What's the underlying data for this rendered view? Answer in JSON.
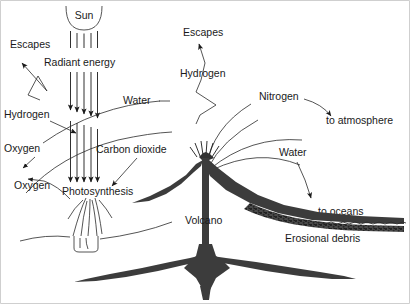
{
  "figure": {
    "background_color": "#ffffff",
    "ink_color": "#1a1a1a",
    "solid_fill_color": "#3c3c3c"
  },
  "labels": {
    "sun": "Sun",
    "escapes_left": "Escapes",
    "radiant_energy": "Radiant energy",
    "hydrogen_left": "Hydrogen",
    "water_left": "Water",
    "oxygen_upper": "Oxygen",
    "carbon_dioxide": "Carbon dioxide",
    "oxygen_lower": "Oxygen",
    "photosynthesis": "Photosynthesis",
    "escapes_right": "Escapes",
    "hydrogen_right": "Hydrogen",
    "nitrogen": "Nitrogen",
    "to_atmosphere": "to atmosphere",
    "water_right": "Water",
    "to_oceans": "to oceans",
    "volcano": "Volcano",
    "erosional_debris": "Erosional debris"
  },
  "elements": {
    "sun_icon": "sun-arc",
    "ray_count": 5,
    "plant_icon": "grass-tuft",
    "volcano_icon": "volcano-cone",
    "magma_icon": "magma-chamber-wedge",
    "debris_icon": "erosional-debris-band",
    "ocean_icon": "water-surface-wavy-line"
  }
}
